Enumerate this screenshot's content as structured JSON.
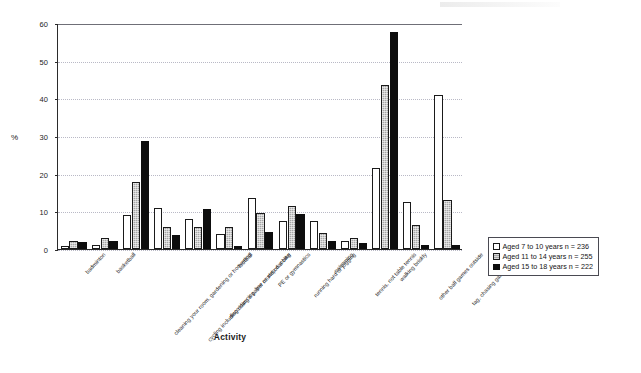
{
  "chart_data": {
    "type": "bar",
    "title": "",
    "xlabel": "Activity",
    "ylabel": "%",
    "ylim": [
      0,
      60
    ],
    "yticks": [
      0,
      10,
      20,
      30,
      40,
      50,
      60
    ],
    "grid": true,
    "legend_position": "right",
    "categories": [
      "badminton",
      "basketball",
      "cleaning your room, gardening or hoovering",
      "cycling including doing a paper round on a bike",
      "disco dancing, line or step dancing",
      "football",
      "PE or gymnastics",
      "running hard or jogging",
      "swimming",
      "tennis, not table tennis",
      "walking briskly",
      "other ball games outside",
      "tag, chasing games outside"
    ],
    "series": [
      {
        "name": "Aged 7 to 10 years n = 236",
        "color": "#ffffff",
        "values": [
          0.7,
          1.0,
          9.0,
          11.0,
          8.0,
          4.0,
          13.5,
          7.5,
          7.5,
          2.0,
          21.5,
          12.5,
          41.0
        ]
      },
      {
        "name": "Aged 11 to 14 years n = 255",
        "color": "#a6a6a6",
        "values": [
          2.0,
          3.0,
          17.7,
          5.8,
          5.8,
          5.8,
          9.5,
          11.5,
          4.3,
          3.0,
          43.5,
          6.3,
          13.0
        ]
      },
      {
        "name": "Aged 15 to 18 years n = 222",
        "color": "#0d0d0d",
        "values": [
          1.8,
          2.0,
          28.8,
          3.8,
          10.5,
          0.8,
          4.5,
          9.3,
          2.0,
          1.5,
          57.5,
          1.0,
          1.0
        ]
      }
    ]
  },
  "legend": {
    "items": [
      {
        "label": "Aged 7 to 10 years n = 236"
      },
      {
        "label": "Aged 11 to 14 years n = 255"
      },
      {
        "label": "Aged 15 to 18 years n = 222"
      }
    ]
  }
}
